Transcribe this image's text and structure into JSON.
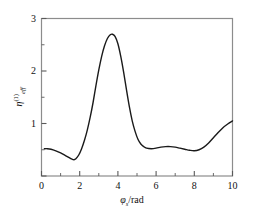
{
  "chart_data": {
    "type": "line",
    "title": "",
    "subtitle": "",
    "xlabel": "φₛ/rad",
    "xlabel_symbol": "φ",
    "xlabel_sub": "s",
    "xlabel_unit": "/rad",
    "ylabel": "ηᵉᶠᶠ(1)",
    "ylabel_symbol": "η",
    "ylabel_sup": "(1)",
    "ylabel_sub": "eff",
    "xlim": [
      0,
      10
    ],
    "ylim": [
      0,
      3
    ],
    "xticks": [
      0,
      2,
      4,
      6,
      8,
      10
    ],
    "xtick_labels": [
      "0",
      "2",
      "4",
      "6",
      "8",
      "10"
    ],
    "xminor_step": 1,
    "yticks": [
      0,
      1,
      2,
      3
    ],
    "ytick_labels": [
      "",
      "1",
      "2",
      "3"
    ],
    "yminor_step": 0.5,
    "grid": false,
    "legend": null,
    "line_color": "#1a1a1a",
    "line_width": 1.4,
    "frame_color": "#808080",
    "series": [
      {
        "name": "eta_eff",
        "x": [
          0.15,
          0.3,
          0.5,
          0.75,
          1.0,
          1.25,
          1.45,
          1.6,
          1.7,
          1.8,
          1.95,
          2.1,
          2.25,
          2.4,
          2.55,
          2.7,
          2.85,
          3.0,
          3.15,
          3.3,
          3.45,
          3.6,
          3.72,
          3.85,
          4.0,
          4.15,
          4.3,
          4.45,
          4.6,
          4.75,
          4.9,
          5.05,
          5.2,
          5.35,
          5.5,
          5.75,
          6.0,
          6.25,
          6.5,
          6.75,
          7.0,
          7.25,
          7.5,
          7.75,
          8.0,
          8.25,
          8.5,
          8.75,
          9.0,
          9.25,
          9.5,
          9.75,
          10.0
        ],
        "y": [
          0.52,
          0.52,
          0.51,
          0.48,
          0.44,
          0.39,
          0.35,
          0.32,
          0.31,
          0.33,
          0.4,
          0.52,
          0.68,
          0.88,
          1.12,
          1.4,
          1.72,
          2.02,
          2.28,
          2.48,
          2.62,
          2.69,
          2.7,
          2.66,
          2.52,
          2.28,
          1.98,
          1.64,
          1.32,
          1.05,
          0.85,
          0.7,
          0.61,
          0.56,
          0.53,
          0.52,
          0.53,
          0.55,
          0.56,
          0.56,
          0.55,
          0.53,
          0.51,
          0.49,
          0.48,
          0.5,
          0.55,
          0.63,
          0.73,
          0.83,
          0.92,
          0.99,
          1.05
        ]
      }
    ]
  },
  "axes": {
    "x_ticks": [
      {
        "value": 0,
        "label": "0"
      },
      {
        "value": 2,
        "label": "2"
      },
      {
        "value": 4,
        "label": "4"
      },
      {
        "value": 6,
        "label": "6"
      },
      {
        "value": 8,
        "label": "8"
      },
      {
        "value": 10,
        "label": "10"
      }
    ],
    "y_ticks": [
      {
        "value": 1,
        "label": "1"
      },
      {
        "value": 2,
        "label": "2"
      },
      {
        "value": 3,
        "label": "3"
      }
    ]
  }
}
